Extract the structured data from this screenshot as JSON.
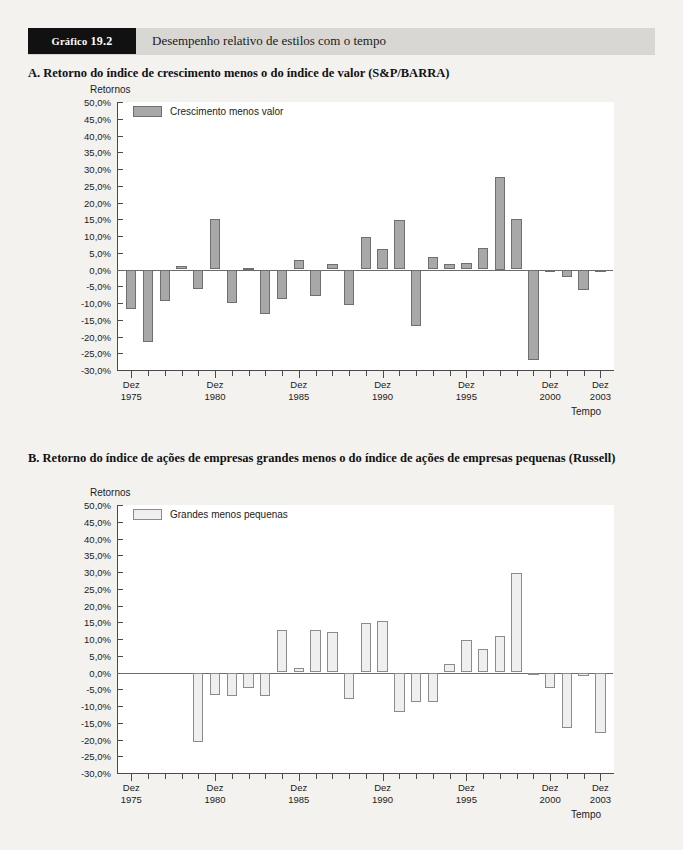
{
  "exhibit": {
    "tag_label": "Gráfico",
    "tag_number": "19.2",
    "title": "Desempenho relativo de estilos com o tempo"
  },
  "panels": [
    {
      "id": "A",
      "title": "A. Retorno do índice de crescimento menos o do índice de valor (S&P/BARRA)"
    },
    {
      "id": "B",
      "title": "B. Retorno do índice de ações de empresas grandes menos o do índice de ações de empresas pequenas (Russell)"
    }
  ],
  "axis": {
    "y_title": "Retornos",
    "x_title": "Tempo",
    "y_ticks": [
      "50,0%",
      "45,0%",
      "40,0%",
      "35,0%",
      "30,0%",
      "25,0%",
      "20,0%",
      "15,0%",
      "10,0%",
      "5,0%",
      "0,0%",
      "-5,0%",
      "-10,0%",
      "-15,0%",
      "-20,0%",
      "-25,0%",
      "-30,0%"
    ],
    "x_tick_labels": [
      {
        "top": "Dez",
        "bottom": "1975"
      },
      {
        "top": "Dez",
        "bottom": "1980"
      },
      {
        "top": "Dez",
        "bottom": "1985"
      },
      {
        "top": "Dez",
        "bottom": "1990"
      },
      {
        "top": "Dez",
        "bottom": "1995"
      },
      {
        "top": "Dez",
        "bottom": "2000"
      },
      {
        "top": "Dez",
        "bottom": "2003"
      }
    ]
  },
  "colors": {
    "bar_a_fill": "#a8a8a8",
    "bar_a_stroke": "#6f6f6f",
    "bar_b_fill": "#efefef",
    "bar_b_stroke": "#8b8b8b",
    "header_bar": "#d8d7d3",
    "header_tag": "#111111",
    "page": "#f3f2ef"
  },
  "chart_data": [
    {
      "type": "bar",
      "panel": "A",
      "title": "A. Retorno do índice de crescimento menos o do índice de valor (S&P/BARRA)",
      "xlabel": "Tempo",
      "ylabel": "Retornos",
      "ylim": [
        -30,
        50
      ],
      "ytick_step": 5,
      "grid": false,
      "legend_position": "top-left",
      "legend": [
        "Crescimento menos valor"
      ],
      "series_name": "Crescimento menos valor",
      "categories": [
        "1975",
        "1976",
        "1977",
        "1978",
        "1979",
        "1980",
        "1981",
        "1982",
        "1983",
        "1984",
        "1985",
        "1986",
        "1987",
        "1988",
        "1989",
        "1990",
        "1991",
        "1992",
        "1993",
        "1994",
        "1995",
        "1996",
        "1997",
        "1998",
        "1999",
        "2000",
        "2001",
        "2002",
        "2003"
      ],
      "values": [
        -11.7,
        -21.7,
        -9.3,
        1.1,
        -5.9,
        15.2,
        -10.0,
        0.5,
        -13.4,
        -8.9,
        2.8,
        -8.0,
        1.7,
        -10.6,
        9.6,
        6.0,
        14.8,
        -16.8,
        3.8,
        1.5,
        2.0,
        6.4,
        27.5,
        15.1,
        -26.9,
        -0.8,
        -2.2,
        -6.0,
        0.0
      ],
      "note": "Valores lidos das barras; último ponto (2003) próximo de zero"
    },
    {
      "type": "bar",
      "panel": "B",
      "title": "B. Retorno do índice de ações de empresas grandes menos o do índice de ações de empresas pequenas (Russell)",
      "xlabel": "Tempo",
      "ylabel": "Retornos",
      "ylim": [
        -30,
        50
      ],
      "ytick_step": 5,
      "grid": false,
      "legend_position": "top-left",
      "legend": [
        "Grandes menos pequenas"
      ],
      "series_name": "Grandes menos pequenas",
      "categories": [
        "1975",
        "1976",
        "1977",
        "1978",
        "1979",
        "1980",
        "1981",
        "1982",
        "1983",
        "1984",
        "1985",
        "1986",
        "1987",
        "1988",
        "1989",
        "1990",
        "1991",
        "1992",
        "1993",
        "1994",
        "1995",
        "1996",
        "1997",
        "1998",
        "1999",
        "2000",
        "2001",
        "2002",
        "2003"
      ],
      "values": [
        null,
        null,
        null,
        null,
        -20.6,
        -6.7,
        -6.9,
        -4.7,
        -7.0,
        12.6,
        1.3,
        12.6,
        12.0,
        -8.0,
        14.8,
        15.3,
        -11.7,
        -8.8,
        -8.7,
        2.4,
        9.8,
        6.9,
        10.8,
        29.7,
        -0.6,
        -4.5,
        -16.6,
        -1.1,
        -18.1
      ],
      "note": "Primeiros quatro anos sem dados"
    }
  ]
}
